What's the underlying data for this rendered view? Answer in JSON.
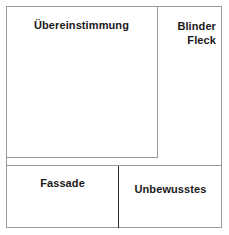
{
  "diagram": {
    "type": "johari-window",
    "colors": {
      "frame": "#9a9a9a",
      "divider_light": "#9a9a9a",
      "divider_dark": "#2b2b2b",
      "text": "#1a1a1a",
      "background": "#ffffff"
    },
    "quadrants": [
      {
        "key": "open",
        "label": "Übereinstimmung",
        "position": "top-left",
        "align": "center"
      },
      {
        "key": "blind",
        "label": "Blinder\nFleck",
        "position": "top-right",
        "align": "right"
      },
      {
        "key": "hidden",
        "label": "Fassade",
        "position": "bottom-left",
        "align": "center"
      },
      {
        "key": "unknown",
        "label": "Unbewusstes",
        "position": "bottom-right",
        "align": "center"
      }
    ]
  }
}
